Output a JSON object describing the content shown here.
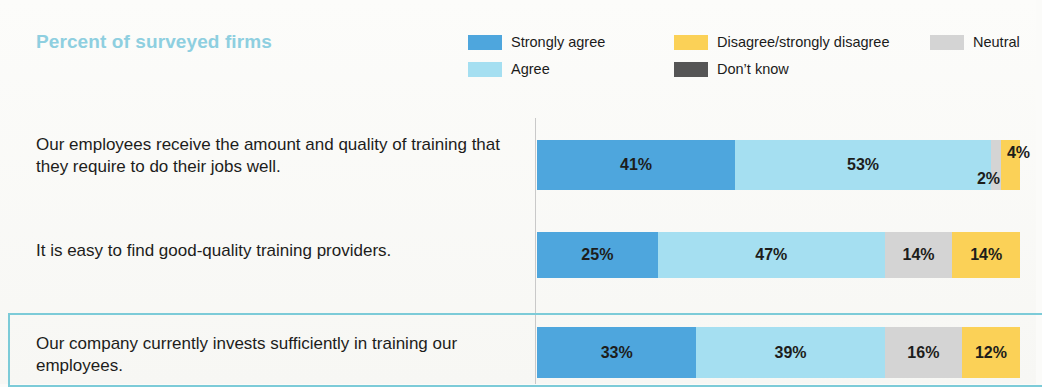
{
  "chart_data": {
    "type": "bar",
    "subtype": "stacked-horizontal-100",
    "title": "Percent of surveyed firms",
    "xlabel": "",
    "ylabel": "",
    "xlim": [
      0,
      100
    ],
    "grid": false,
    "legend_position": "top-right",
    "categories": [
      "Our employees receive the amount and quality of training that they require to do their jobs well.",
      "It is easy to find good-quality training providers.",
      "Our company currently invests sufficiently in training our employees."
    ],
    "series": [
      {
        "name": "Strongly agree",
        "color": "#4ea6dd",
        "values": [
          41,
          25,
          33
        ]
      },
      {
        "name": "Agree",
        "color": "#a5dff1",
        "values": [
          53,
          47,
          39
        ]
      },
      {
        "name": "Neutral",
        "color": "#d4d4d4",
        "values": [
          2,
          14,
          16
        ]
      },
      {
        "name": "Disagree/strongly disagree",
        "color": "#fbd157",
        "values": [
          4,
          14,
          12
        ]
      },
      {
        "name": "Don't know",
        "color": "#555555",
        "values": [
          0,
          0,
          0
        ]
      }
    ],
    "value_labels": [
      [
        "41%",
        "53%",
        "2%",
        "4%"
      ],
      [
        "25%",
        "47%",
        "14%",
        "14%"
      ],
      [
        "33%",
        "39%",
        "16%",
        "12%"
      ]
    ]
  },
  "header": {
    "title": "Percent of surveyed firms",
    "title_color": "#8ecfe0"
  },
  "legend": {
    "items": [
      {
        "label": "Strongly agree",
        "color": "#4ea6dd"
      },
      {
        "label": "Agree",
        "color": "#a5dff1"
      },
      {
        "label": "Disagree/strongly disagree",
        "color": "#fbd157"
      },
      {
        "label": "Don’t know",
        "color": "#555555"
      },
      {
        "label": "Neutral",
        "color": "#d4d4d4"
      }
    ]
  },
  "rows": [
    {
      "label": "Our employees receive the amount and quality of training that they require to do their jobs well.",
      "highlighted": false,
      "segments": [
        {
          "name": "Strongly agree",
          "value": 41,
          "label": "41%",
          "color": "#4ea6dd",
          "show_label": true
        },
        {
          "name": "Agree",
          "value": 53,
          "label": "53%",
          "color": "#a5dff1",
          "show_label": true
        },
        {
          "name": "Neutral",
          "value": 2,
          "label": "2%",
          "color": "#d4d4d4",
          "show_label": false
        },
        {
          "name": "Disagree/strongly disagree",
          "value": 4,
          "label": "4%",
          "color": "#fbd157",
          "show_label": false
        }
      ],
      "callout_top": "4%",
      "callout_bottom": "2%"
    },
    {
      "label": "It is easy to find good-quality training providers.",
      "highlighted": false,
      "segments": [
        {
          "name": "Strongly agree",
          "value": 25,
          "label": "25%",
          "color": "#4ea6dd",
          "show_label": true
        },
        {
          "name": "Agree",
          "value": 47,
          "label": "47%",
          "color": "#a5dff1",
          "show_label": true
        },
        {
          "name": "Neutral",
          "value": 14,
          "label": "14%",
          "color": "#d4d4d4",
          "show_label": true
        },
        {
          "name": "Disagree/strongly disagree",
          "value": 14,
          "label": "14%",
          "color": "#fbd157",
          "show_label": true
        }
      ],
      "callout_top": "",
      "callout_bottom": ""
    },
    {
      "label": "Our company currently invests sufficiently in training our employees.",
      "highlighted": true,
      "segments": [
        {
          "name": "Strongly agree",
          "value": 33,
          "label": "33%",
          "color": "#4ea6dd",
          "show_label": true
        },
        {
          "name": "Agree",
          "value": 39,
          "label": "39%",
          "color": "#a5dff1",
          "show_label": true
        },
        {
          "name": "Neutral",
          "value": 16,
          "label": "16%",
          "color": "#d4d4d4",
          "show_label": true
        },
        {
          "name": "Disagree/strongly disagree",
          "value": 12,
          "label": "12%",
          "color": "#fbd157",
          "show_label": true
        }
      ],
      "callout_top": "",
      "callout_bottom": ""
    }
  ],
  "highlight": {
    "border_color": "#7ccbd8"
  }
}
